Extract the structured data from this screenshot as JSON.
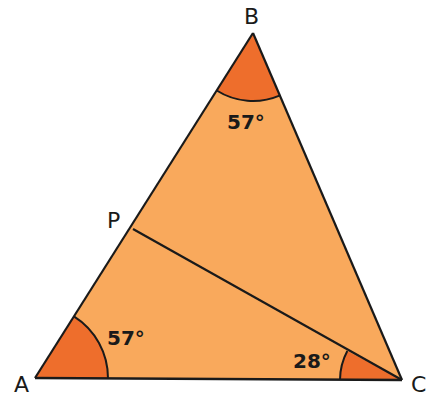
{
  "diagram": {
    "type": "triangle-geometry",
    "colors": {
      "fill": "#f9a95c",
      "angle_fill": "#ee6e2c",
      "stroke": "#1a1a1a"
    },
    "vertices": {
      "A": {
        "label": "A",
        "x": 35,
        "y": 378
      },
      "B": {
        "label": "B",
        "x": 253,
        "y": 33
      },
      "C": {
        "label": "C",
        "x": 402,
        "y": 380
      },
      "P": {
        "label": "P",
        "x": 133,
        "y": 229
      }
    },
    "segments": [
      "AB",
      "BC",
      "CA",
      "PC"
    ],
    "angles": {
      "A": {
        "value": "57°",
        "between": [
          "AB",
          "AC"
        ]
      },
      "B": {
        "value": "57°",
        "between": [
          "BA",
          "BC"
        ]
      },
      "C": {
        "value": "28°",
        "between": [
          "CP",
          "CA"
        ]
      }
    }
  }
}
